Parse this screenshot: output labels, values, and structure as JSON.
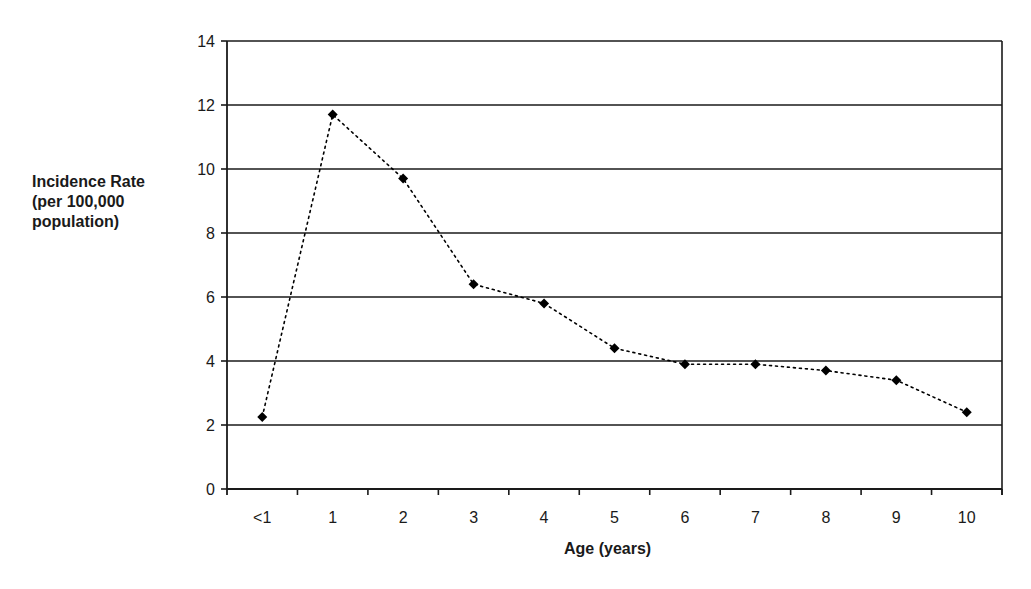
{
  "chart_data": {
    "type": "line",
    "title": "",
    "xlabel": "Age (years)",
    "ylabel": "Incidence Rate\n(per 100,000\npopulation)",
    "categories": [
      "<1",
      "1",
      "2",
      "3",
      "4",
      "5",
      "6",
      "7",
      "8",
      "9",
      "10"
    ],
    "series": [
      {
        "name": "Incidence Rate",
        "values": [
          2.25,
          11.7,
          9.7,
          6.4,
          5.8,
          4.4,
          3.9,
          3.9,
          3.7,
          3.4,
          2.4
        ],
        "line_style": "dotted",
        "marker": "diamond",
        "color": "#000000"
      }
    ],
    "ylim": [
      0,
      14
    ],
    "yticks": [
      0,
      2,
      4,
      6,
      8,
      10,
      12,
      14
    ],
    "grid": "horizontal",
    "legend": "none"
  },
  "colors": {
    "axis": "#1a1a1a",
    "grid": "#1a1a1a",
    "series": "#000000",
    "background": "#ffffff"
  }
}
